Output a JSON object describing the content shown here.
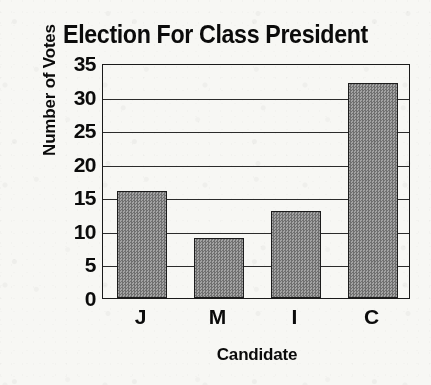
{
  "chart_data": {
    "type": "bar",
    "title": "Election For Class President",
    "xlabel": "Candidate",
    "ylabel": "Number of Votes",
    "categories": [
      "J",
      "M",
      "I",
      "C"
    ],
    "values": [
      16,
      9,
      13,
      32
    ],
    "ylim": [
      0,
      35
    ],
    "ytick_step": 5,
    "yticks": [
      0,
      5,
      10,
      15,
      20,
      25,
      30,
      35
    ],
    "ytick_labels": [
      "0",
      "5",
      "10",
      "15",
      "20",
      "25",
      "30",
      "35"
    ],
    "grid": "horizontal",
    "legend": "none",
    "bar_fill_color": "#8a8a8a",
    "bar_edge_color": "#1c1c1c",
    "axis_color": "#1a1a1a",
    "background_color": "#f7f7f4",
    "text_color": "#0b0b0b"
  }
}
